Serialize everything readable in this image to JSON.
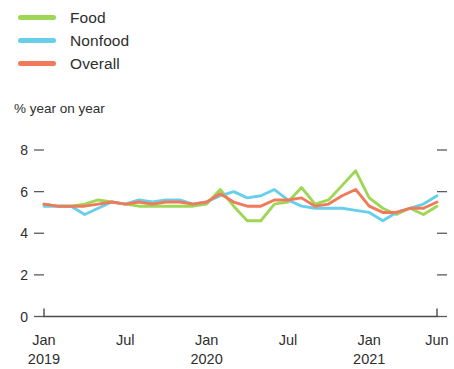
{
  "legend": {
    "position": "top-left",
    "items": [
      {
        "label": "Food",
        "color": "#9ed756",
        "icon": "line-swatch-icon"
      },
      {
        "label": "Nonfood",
        "color": "#68cfea",
        "icon": "line-swatch-icon"
      },
      {
        "label": "Overall",
        "color": "#f07a5a",
        "icon": "line-swatch-icon"
      }
    ]
  },
  "axis_title": "% year on year",
  "y_ticks": [
    "8",
    "6",
    "4",
    "2",
    "0"
  ],
  "x_ticks": [
    {
      "month": "Jan",
      "year": "2019"
    },
    {
      "month": "Jul",
      "year": ""
    },
    {
      "month": "Jan",
      "year": "2020"
    },
    {
      "month": "Jul",
      "year": ""
    },
    {
      "month": "Jan",
      "year": "2021"
    },
    {
      "month": "Jun",
      "year": ""
    }
  ],
  "chart_data": {
    "type": "line",
    "title": "",
    "subtitle": "",
    "xlabel": "",
    "ylabel": "% year on year",
    "ylim": [
      0,
      8
    ],
    "yticks": [
      0,
      2,
      4,
      6,
      8
    ],
    "grid": false,
    "legend_position": "top-left",
    "x": [
      "Jan 2019",
      "Feb 2019",
      "Mar 2019",
      "Apr 2019",
      "May 2019",
      "Jun 2019",
      "Jul 2019",
      "Aug 2019",
      "Sep 2019",
      "Oct 2019",
      "Nov 2019",
      "Dec 2019",
      "Jan 2020",
      "Feb 2020",
      "Mar 2020",
      "Apr 2020",
      "May 2020",
      "Jun 2020",
      "Jul 2020",
      "Aug 2020",
      "Sep 2020",
      "Oct 2020",
      "Nov 2020",
      "Dec 2020",
      "Jan 2021",
      "Feb 2021",
      "Mar 2021",
      "Apr 2021",
      "May 2021",
      "Jun 2021"
    ],
    "xtick_labels": [
      "Jan 2019",
      "Jul",
      "Jan 2020",
      "Jul",
      "Jan 2021",
      "Jun"
    ],
    "series": [
      {
        "name": "Food",
        "color": "#9ed756",
        "values": [
          5.4,
          5.3,
          5.3,
          5.4,
          5.6,
          5.5,
          5.4,
          5.3,
          5.3,
          5.3,
          5.3,
          5.3,
          5.4,
          6.1,
          5.3,
          4.6,
          4.6,
          5.4,
          5.5,
          6.2,
          5.4,
          5.6,
          6.3,
          7.0,
          5.7,
          5.2,
          4.9,
          5.2,
          4.9,
          5.3
        ]
      },
      {
        "name": "Nonfood",
        "color": "#68cfea",
        "values": [
          5.3,
          5.3,
          5.3,
          4.9,
          5.2,
          5.5,
          5.4,
          5.6,
          5.5,
          5.6,
          5.6,
          5.4,
          5.5,
          5.8,
          6.0,
          5.7,
          5.8,
          6.1,
          5.6,
          5.3,
          5.2,
          5.2,
          5.2,
          5.1,
          5.0,
          4.6,
          5.0,
          5.2,
          5.4,
          5.8
        ]
      },
      {
        "name": "Overall",
        "color": "#f07a5a",
        "values": [
          5.4,
          5.3,
          5.3,
          5.3,
          5.4,
          5.5,
          5.4,
          5.5,
          5.4,
          5.5,
          5.5,
          5.4,
          5.5,
          5.9,
          5.5,
          5.3,
          5.3,
          5.6,
          5.6,
          5.7,
          5.3,
          5.4,
          5.8,
          6.1,
          5.3,
          5.0,
          5.0,
          5.2,
          5.2,
          5.5
        ]
      }
    ]
  }
}
